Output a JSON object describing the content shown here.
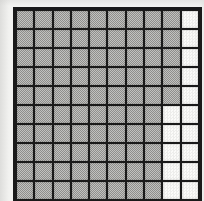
{
  "figure": {
    "name": "shaded-grid",
    "background_color": "#f2f2f0"
  },
  "grid": {
    "rows": 10,
    "columns": 10,
    "total_cells": 100,
    "shaded_count": 85,
    "empty_count": 15,
    "line_color": "#1a1a1a",
    "shaded_color": "#a9a9a7",
    "empty_color": "#fbfbf9",
    "states": [
      [
        "shaded",
        "shaded",
        "shaded",
        "shaded",
        "shaded",
        "shaded",
        "shaded",
        "shaded",
        "shaded",
        "empty"
      ],
      [
        "shaded",
        "shaded",
        "shaded",
        "shaded",
        "shaded",
        "shaded",
        "shaded",
        "shaded",
        "shaded",
        "empty"
      ],
      [
        "shaded",
        "shaded",
        "shaded",
        "shaded",
        "shaded",
        "shaded",
        "shaded",
        "shaded",
        "shaded",
        "empty"
      ],
      [
        "shaded",
        "shaded",
        "shaded",
        "shaded",
        "shaded",
        "shaded",
        "shaded",
        "shaded",
        "shaded",
        "empty"
      ],
      [
        "shaded",
        "shaded",
        "shaded",
        "shaded",
        "shaded",
        "shaded",
        "shaded",
        "shaded",
        "shaded",
        "empty"
      ],
      [
        "shaded",
        "shaded",
        "shaded",
        "shaded",
        "shaded",
        "shaded",
        "shaded",
        "shaded",
        "empty",
        "empty"
      ],
      [
        "shaded",
        "shaded",
        "shaded",
        "shaded",
        "shaded",
        "shaded",
        "shaded",
        "shaded",
        "empty",
        "empty"
      ],
      [
        "shaded",
        "shaded",
        "shaded",
        "shaded",
        "shaded",
        "shaded",
        "shaded",
        "shaded",
        "empty",
        "empty"
      ],
      [
        "shaded",
        "shaded",
        "shaded",
        "shaded",
        "shaded",
        "shaded",
        "shaded",
        "shaded",
        "empty",
        "empty"
      ],
      [
        "shaded",
        "shaded",
        "shaded",
        "shaded",
        "shaded",
        "shaded",
        "shaded",
        "shaded",
        "empty",
        "empty"
      ]
    ]
  },
  "chart_data": {
    "type": "heatmap",
    "title": "",
    "xlabel": "",
    "ylabel": "",
    "categories": [
      "1",
      "2",
      "3",
      "4",
      "5",
      "6",
      "7",
      "8",
      "9",
      "10"
    ],
    "row_labels": [
      "1",
      "2",
      "3",
      "4",
      "5",
      "6",
      "7",
      "8",
      "9",
      "10"
    ],
    "legend": [],
    "grid": true,
    "values": [
      [
        1,
        1,
        1,
        1,
        1,
        1,
        1,
        1,
        1,
        0
      ],
      [
        1,
        1,
        1,
        1,
        1,
        1,
        1,
        1,
        1,
        0
      ],
      [
        1,
        1,
        1,
        1,
        1,
        1,
        1,
        1,
        1,
        0
      ],
      [
        1,
        1,
        1,
        1,
        1,
        1,
        1,
        1,
        1,
        0
      ],
      [
        1,
        1,
        1,
        1,
        1,
        1,
        1,
        1,
        1,
        0
      ],
      [
        1,
        1,
        1,
        1,
        1,
        1,
        1,
        1,
        0,
        0
      ],
      [
        1,
        1,
        1,
        1,
        1,
        1,
        1,
        1,
        0,
        0
      ],
      [
        1,
        1,
        1,
        1,
        1,
        1,
        1,
        1,
        0,
        0
      ],
      [
        1,
        1,
        1,
        1,
        1,
        1,
        1,
        1,
        0,
        0
      ],
      [
        1,
        1,
        1,
        1,
        1,
        1,
        1,
        1,
        0,
        0
      ]
    ],
    "value_meaning": {
      "1": "shaded",
      "0": "empty"
    },
    "shaded_count": 85,
    "empty_count": 15,
    "total_cells": 100,
    "shaded_fraction": "85/100"
  }
}
